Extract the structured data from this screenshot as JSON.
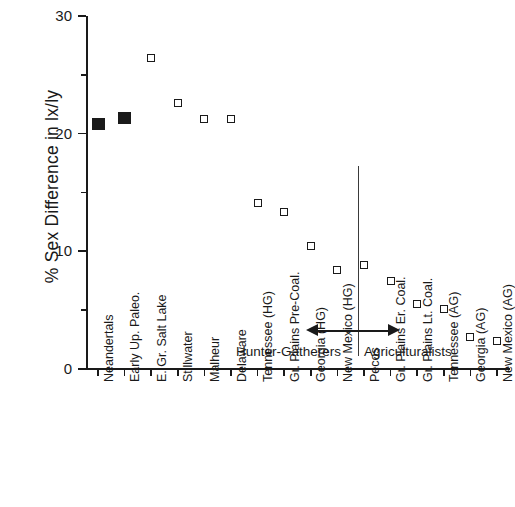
{
  "chart_data": {
    "type": "scatter",
    "title": "",
    "xlabel": "",
    "ylabel": "% Sex Difference in lx/ly",
    "ylim": [
      0,
      30
    ],
    "ytick_labels": [
      "0",
      "10",
      "20",
      "30"
    ],
    "ytick_values": [
      0,
      10,
      20,
      30
    ],
    "yminor_values": [
      5,
      15,
      25
    ],
    "grid": false,
    "legend": false,
    "categories": [
      "Neandertals",
      "Early Up. Paleo.",
      "E. Gr. Salt Lake",
      "Stillwater",
      "Malheur",
      "Delaware",
      "Tennessee (HG)",
      "Gr. Plains Pre-Coal.",
      "Georgia (HG)",
      "New Mexico (HG)",
      "Pecos",
      "Gr. Plains Er. Coal.",
      "Gr. Plains Lt. Coal.",
      "Tennessee (AG)",
      "Georgia (AG)",
      "New Mexico (AG)"
    ],
    "values": [
      20.8,
      21.3,
      26.4,
      22.6,
      21.2,
      21.2,
      14.1,
      13.3,
      10.4,
      8.4,
      8.8,
      7.5,
      5.5,
      5.1,
      2.7,
      2.4
    ],
    "marker_styles": [
      "filled",
      "filled",
      "open",
      "open",
      "open",
      "open",
      "open",
      "open",
      "open",
      "open",
      "open",
      "open",
      "open",
      "open",
      "open",
      "open"
    ],
    "annotations": [
      {
        "id": "hunter-gatherers",
        "text": "Hunter-Gatherers",
        "arrow": "left"
      },
      {
        "id": "agriculturalists",
        "text": "Agriculturalists",
        "arrow": "right"
      }
    ],
    "divider": {
      "after_category_index": 10
    },
    "colors": {
      "axis": "#1a1a1a",
      "marker_fill_closed": "#1a1a1a",
      "marker_fill_open": "#ffffff",
      "marker_edge": "#1a1a1a",
      "divider": "#3a3a3a",
      "background": "#ffffff"
    }
  }
}
